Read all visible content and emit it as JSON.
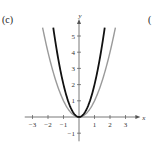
{
  "panel_label": "(c)",
  "edge_label": "(",
  "chart_data": {
    "type": "line",
    "title": "",
    "xlabel": "x",
    "ylabel": "y",
    "xlim": [
      -3.5,
      3.7
    ],
    "ylim": [
      -1.5,
      5.8
    ],
    "xticks": [
      -3,
      -2,
      -1,
      1,
      2,
      3
    ],
    "xtick_labels": [
      "−3",
      "−2",
      "−1",
      "1",
      "2",
      "3"
    ],
    "yticks": [
      -1,
      1,
      2,
      3,
      4,
      5
    ],
    "ytick_labels": [
      "−1",
      "1",
      "2",
      "3",
      "4",
      "5"
    ],
    "grid": false,
    "series": [
      {
        "name": "y = x^2",
        "color": "#9a9a9a",
        "function": "x^2",
        "x_range": [
          -2.35,
          2.35
        ]
      },
      {
        "name": "y = 2x^2",
        "color": "#111111",
        "function": "2x^2",
        "x_range": [
          -1.66,
          1.66
        ]
      }
    ]
  }
}
